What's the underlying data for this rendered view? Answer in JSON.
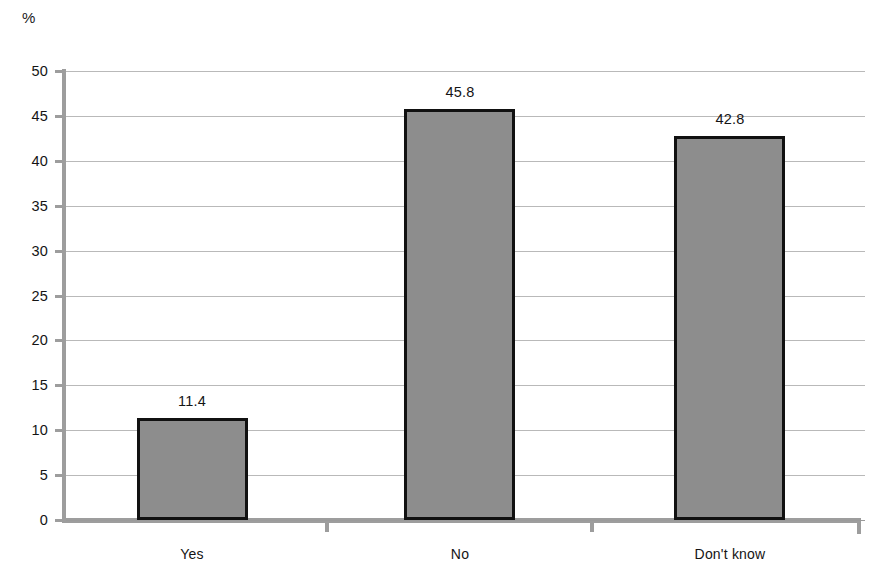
{
  "chart_data": {
    "type": "bar",
    "title": "",
    "subtitle": "",
    "xlabel": "",
    "ylabel": "%",
    "unit_label": "%",
    "categories": [
      "Yes",
      "No",
      "Don't know"
    ],
    "values": [
      11.4,
      45.8,
      42.8
    ],
    "value_labels": [
      "11.4",
      "45.8",
      "42.8"
    ],
    "ylim": [
      0,
      50
    ],
    "ytick_labels": [
      "50",
      "45",
      "40",
      "35",
      "30",
      "25",
      "20",
      "15",
      "10",
      "5",
      "0"
    ],
    "yticks": [
      50,
      45,
      40,
      35,
      30,
      25,
      20,
      15,
      10,
      5,
      0
    ],
    "grid": true,
    "grid_axis": "y",
    "legend": false,
    "legend_position": "none",
    "series": [
      {
        "name": "Percent of respondents",
        "values": [
          11.4,
          45.8,
          42.8
        ]
      }
    ],
    "colors": {
      "bar_fill": "#8d8d8d",
      "bar_border": "#111111",
      "gridline": "#b9b9b9",
      "axis": "#9d9d9d",
      "text": "#141414",
      "background": "#ffffff"
    }
  }
}
